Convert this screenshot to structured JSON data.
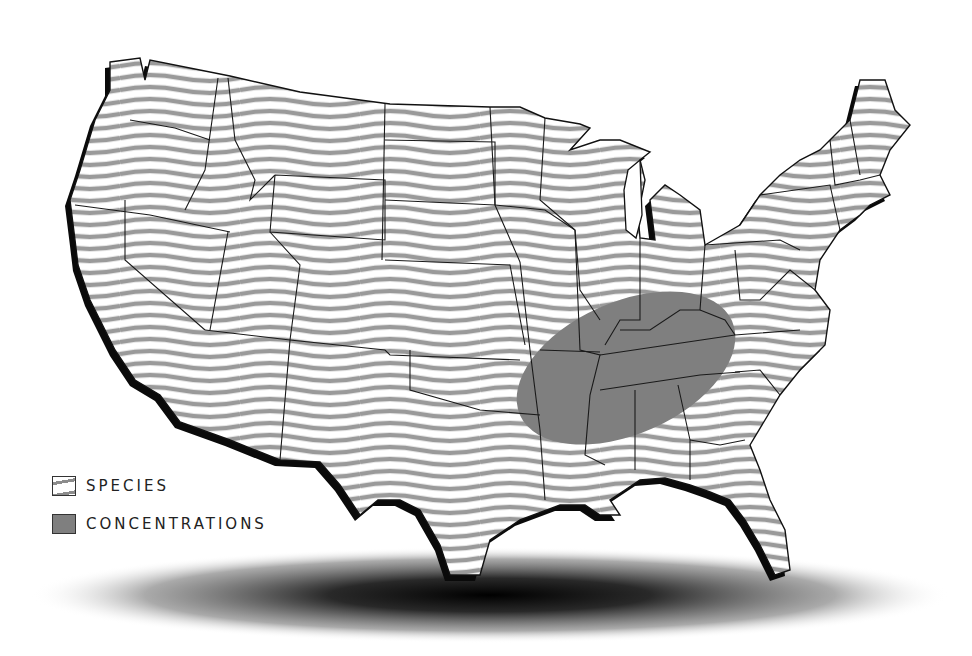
{
  "map": {
    "subject": "Contiguous United States species distribution",
    "background_color": "#ffffff",
    "species_fill": "wavy-stripes",
    "stripe_color": "#8c8c8c",
    "concentration_color": "#7f7f7f",
    "outline_color": "#111111",
    "shadow_color": "#000000",
    "concentration_region": "Ellipse over Arkansas, Missouri bootheel, Tennessee, Kentucky, northern Mississippi and Alabama"
  },
  "legend": {
    "items": [
      {
        "label": "SPECIES",
        "swatch": "wavy-stripes"
      },
      {
        "label": "CONCENTRATIONS",
        "swatch": "solid-grey"
      }
    ]
  }
}
